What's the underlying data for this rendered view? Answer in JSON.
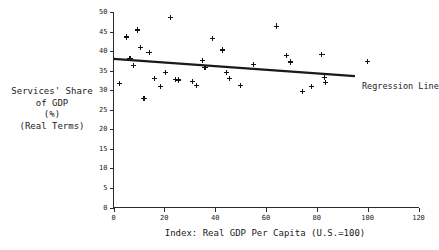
{
  "chart_data": {
    "type": "scatter",
    "title": "",
    "xlabel": "Index: Real GDP Per Capita (U.S.=100)",
    "ylabel_lines": [
      "Services' Share",
      "of GDP",
      "(%)",
      "(Real Terms)"
    ],
    "ylabel": "Services' Share of GDP (%) (Real Terms)",
    "xlim": [
      0,
      120
    ],
    "ylim": [
      0,
      50
    ],
    "xticks": [
      0,
      20,
      40,
      60,
      80,
      100,
      120
    ],
    "yticks": [
      0,
      5,
      10,
      15,
      20,
      25,
      30,
      35,
      40,
      45,
      50
    ],
    "grid": false,
    "legend_position": "inline-right",
    "marker": "plus",
    "annotations": [
      {
        "text": "Regression Line",
        "x": 98,
        "y": 34.5
      }
    ],
    "series": [
      {
        "name": "Countries",
        "marker": "plus",
        "points": [
          {
            "x": 2.5,
            "y": 31.8
          },
          {
            "x": 5.0,
            "y": 43.6
          },
          {
            "x": 6.5,
            "y": 38.2
          },
          {
            "x": 8.0,
            "y": 36.4
          },
          {
            "x": 9.5,
            "y": 45.4
          },
          {
            "x": 10.5,
            "y": 41.0
          },
          {
            "x": 12.0,
            "y": 27.9
          },
          {
            "x": 14.0,
            "y": 39.7
          },
          {
            "x": 16.0,
            "y": 33.0
          },
          {
            "x": 18.5,
            "y": 30.9
          },
          {
            "x": 20.5,
            "y": 34.6
          },
          {
            "x": 22.5,
            "y": 48.6
          },
          {
            "x": 24.5,
            "y": 32.8
          },
          {
            "x": 25.5,
            "y": 32.6
          },
          {
            "x": 31.0,
            "y": 32.2
          },
          {
            "x": 32.5,
            "y": 31.3
          },
          {
            "x": 35.0,
            "y": 37.6
          },
          {
            "x": 36.0,
            "y": 35.9
          },
          {
            "x": 39.0,
            "y": 43.2
          },
          {
            "x": 43.0,
            "y": 40.3
          },
          {
            "x": 44.5,
            "y": 34.5
          },
          {
            "x": 45.5,
            "y": 32.9
          },
          {
            "x": 50.0,
            "y": 31.1
          },
          {
            "x": 55.0,
            "y": 36.5
          },
          {
            "x": 64.0,
            "y": 46.4
          },
          {
            "x": 68.0,
            "y": 38.8
          },
          {
            "x": 69.5,
            "y": 37.2
          },
          {
            "x": 74.5,
            "y": 29.7
          },
          {
            "x": 78.0,
            "y": 30.9
          },
          {
            "x": 82.0,
            "y": 39.2
          },
          {
            "x": 83.0,
            "y": 33.3
          },
          {
            "x": 83.5,
            "y": 32.0
          },
          {
            "x": 100.0,
            "y": 37.4
          }
        ]
      }
    ],
    "regression_line": {
      "name": "Regression Line",
      "x_start": 0,
      "y_start": 38.0,
      "x_end": 95,
      "y_end": 33.6
    }
  }
}
